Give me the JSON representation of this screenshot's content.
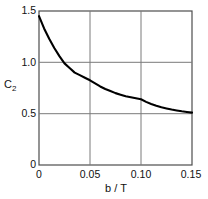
{
  "chart_data": {
    "type": "line",
    "title": "",
    "subtitle": "",
    "xlabel": "b / T",
    "ylabel": "C",
    "ylabel_subscript": "2",
    "xlim": [
      0,
      0.15
    ],
    "ylim": [
      0,
      1.5
    ],
    "grid": true,
    "legend": null,
    "x_ticks": [
      0,
      0.05,
      0.1,
      0.15
    ],
    "x_tick_labels": [
      "0",
      "0.05",
      "0.10",
      "0.15"
    ],
    "y_ticks": [
      0,
      0.5,
      1.0,
      1.5
    ],
    "y_tick_labels": [
      "0",
      "0.5",
      "1.0",
      "1.5"
    ],
    "series": [
      {
        "name": "C2 vs b/T",
        "color": "#000000",
        "x": [
          0.0,
          0.005,
          0.01,
          0.015,
          0.02,
          0.025,
          0.03,
          0.035,
          0.04,
          0.045,
          0.05,
          0.055,
          0.06,
          0.065,
          0.07,
          0.075,
          0.08,
          0.085,
          0.09,
          0.095,
          0.1,
          0.105,
          0.11,
          0.115,
          0.12,
          0.125,
          0.13,
          0.135,
          0.14,
          0.145,
          0.15
        ],
        "values": [
          1.45,
          1.33,
          1.23,
          1.14,
          1.06,
          0.99,
          0.945,
          0.9,
          0.875,
          0.85,
          0.825,
          0.795,
          0.765,
          0.74,
          0.72,
          0.7,
          0.685,
          0.67,
          0.66,
          0.65,
          0.64,
          0.615,
          0.595,
          0.578,
          0.563,
          0.551,
          0.54,
          0.531,
          0.523,
          0.516,
          0.51
        ]
      }
    ],
    "annotations": []
  },
  "axes": {
    "frame_color": "#4d4d4d",
    "grid_color": "#7a7a7a",
    "background": "#ffffff"
  }
}
